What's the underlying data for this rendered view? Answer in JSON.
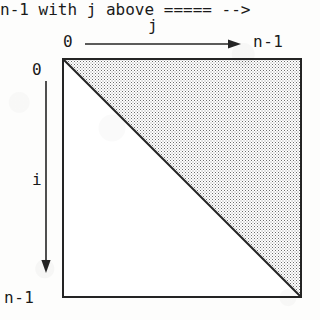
{
  "figure": {
    "kind": "index-range-diagram"
  },
  "colors": {
    "ink": "#242424",
    "stipple_dark": "#6d6d6d",
    "stipple_light": "#8d8d8d",
    "paper": "#fdfdfc",
    "box_fill": "#ffffff"
  },
  "top_axis": {
    "variable": "j",
    "start_label": "0",
    "end_label": "n-1",
    "arrow_direction": "right"
  },
  "left_axis": {
    "variable": "i",
    "start_label": "0",
    "end_label": "n-1",
    "arrow_direction": "down"
  },
  "regions": {
    "shaded": {
      "name": "upper-triangular-region",
      "fill": "stipple",
      "corners": [
        "top-left",
        "top-right",
        "bottom-right"
      ]
    },
    "unshaded": {
      "name": "lower-triangular-region",
      "fill": "white",
      "corners": [
        "top-left",
        "bottom-left",
        "bottom-right"
      ]
    },
    "diagonal": {
      "name": "main-diagonal",
      "from": "top-left",
      "to": "bottom-right"
    }
  }
}
